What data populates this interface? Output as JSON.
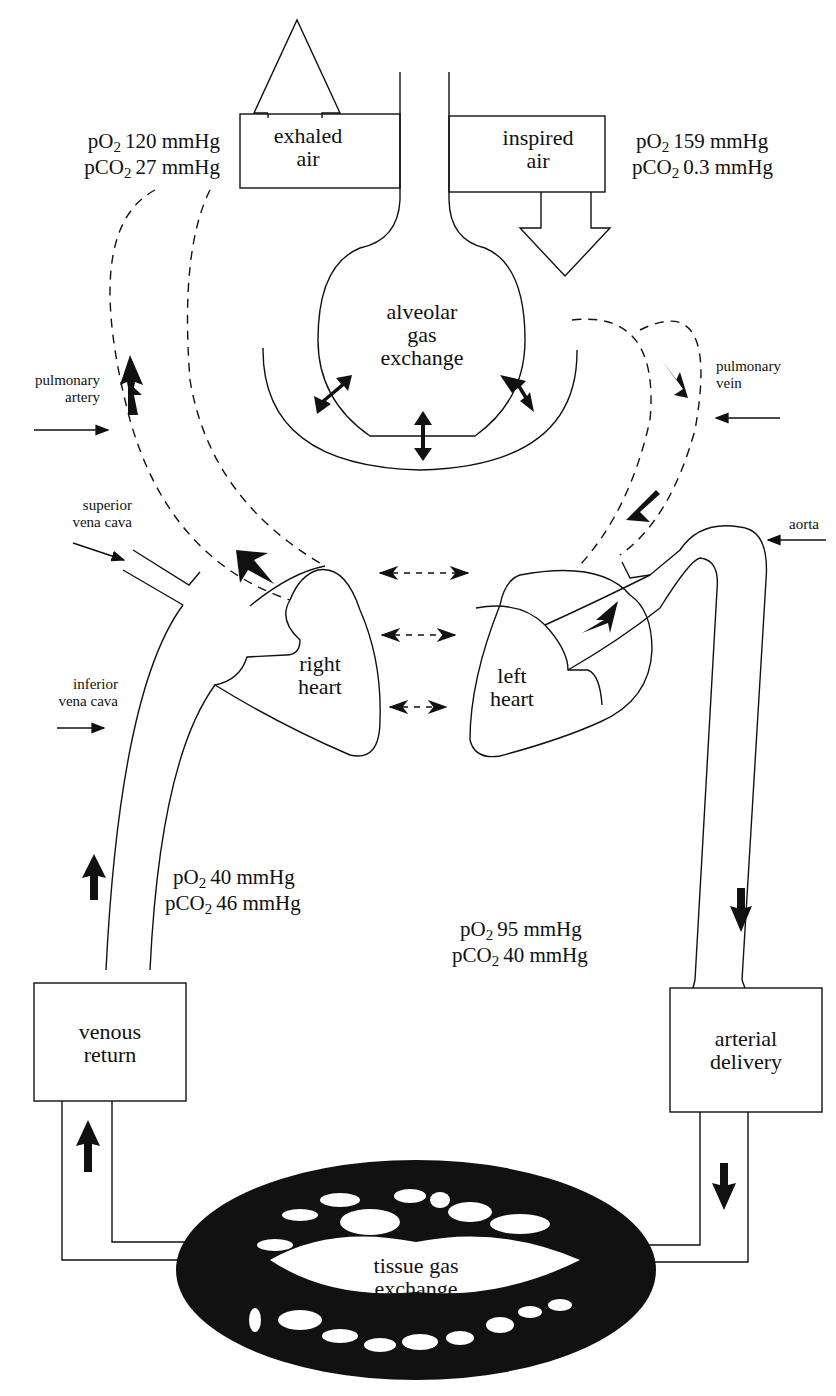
{
  "boxes": {
    "exhaled": {
      "line1": "exhaled",
      "line2": "air"
    },
    "inspired": {
      "line1": "inspired",
      "line2": "air"
    },
    "venous": {
      "line1": "venous",
      "line2": "return"
    },
    "arterial": {
      "line1": "arterial",
      "line2": "delivery"
    }
  },
  "regions": {
    "alveolar": {
      "line1": "alveolar",
      "line2": "gas",
      "line3": "exchange"
    },
    "right_heart": {
      "line1": "right",
      "line2": "heart"
    },
    "left_heart": {
      "line1": "left",
      "line2": "heart"
    },
    "tissue": {
      "line1": "tissue gas",
      "line2": "exchange"
    }
  },
  "vessel_labels": {
    "pulmonary_artery": {
      "line1": "pulmonary",
      "line2": "artery"
    },
    "pulmonary_vein": {
      "line1": "pulmonary",
      "line2": "vein"
    },
    "superior_vena_cava": {
      "line1": "superior",
      "line2": "vena cava"
    },
    "inferior_vena_cava": {
      "line1": "inferior",
      "line2": "vena cava"
    },
    "aorta": {
      "line1": "aorta"
    }
  },
  "gas_values": {
    "exhaled": {
      "po2_prefix": "pO",
      "po2_sub": "2",
      "po2_value": "120 mmHg",
      "pco2_prefix": "pCO",
      "pco2_sub": "2",
      "pco2_value": "27 mmHg"
    },
    "inspired": {
      "po2_prefix": "pO",
      "po2_sub": "2",
      "po2_value": "159 mmHg",
      "pco2_prefix": "pCO",
      "pco2_sub": "2",
      "pco2_value": "0.3 mmHg"
    },
    "venous": {
      "po2_prefix": "pO",
      "po2_sub": "2",
      "po2_value": "40 mmHg",
      "pco2_prefix": "pCO",
      "pco2_sub": "2",
      "pco2_value": "46 mmHg"
    },
    "arterial": {
      "po2_prefix": "pO",
      "po2_sub": "2",
      "po2_value": "95 mmHg",
      "pco2_prefix": "pCO",
      "pco2_sub": "2",
      "pco2_value": "40 mmHg"
    }
  },
  "colors": {
    "ink": "#111111",
    "background": "#ffffff"
  }
}
